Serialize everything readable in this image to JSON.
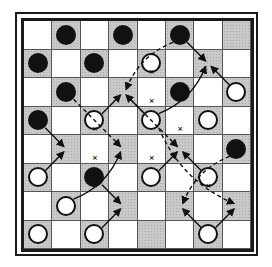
{
  "diagram": {
    "type": "checkerboard-move-diagram",
    "size": 8,
    "dark_square_color": "#c9c9c9",
    "light_square_color": "#ffffff",
    "pieces": [
      {
        "row": 0,
        "col": 1,
        "color": "black"
      },
      {
        "row": 0,
        "col": 3,
        "color": "black"
      },
      {
        "row": 0,
        "col": 5,
        "color": "black"
      },
      {
        "row": 1,
        "col": 0,
        "color": "black"
      },
      {
        "row": 1,
        "col": 2,
        "color": "black"
      },
      {
        "row": 1,
        "col": 4,
        "color": "white"
      },
      {
        "row": 2,
        "col": 1,
        "color": "black"
      },
      {
        "row": 2,
        "col": 5,
        "color": "black"
      },
      {
        "row": 2,
        "col": 7,
        "color": "white"
      },
      {
        "row": 3,
        "col": 0,
        "color": "black"
      },
      {
        "row": 3,
        "col": 2,
        "color": "white"
      },
      {
        "row": 3,
        "col": 4,
        "color": "white"
      },
      {
        "row": 3,
        "col": 6,
        "color": "white"
      },
      {
        "row": 4,
        "col": 7,
        "color": "black"
      },
      {
        "row": 5,
        "col": 0,
        "color": "white"
      },
      {
        "row": 5,
        "col": 2,
        "color": "black"
      },
      {
        "row": 5,
        "col": 4,
        "color": "white"
      },
      {
        "row": 5,
        "col": 6,
        "color": "white"
      },
      {
        "row": 6,
        "col": 1,
        "color": "white"
      },
      {
        "row": 7,
        "col": 0,
        "color": "white"
      },
      {
        "row": 7,
        "col": 2,
        "color": "white"
      },
      {
        "row": 7,
        "col": 6,
        "color": "white"
      }
    ],
    "solid_arrows": [
      {
        "from": [
          5,
          0
        ],
        "to": [
          4,
          1
        ]
      },
      {
        "from": [
          6,
          1
        ],
        "to": [
          4,
          3
        ],
        "curved": true
      },
      {
        "from": [
          7,
          2
        ],
        "to": [
          6,
          3
        ]
      },
      {
        "from": [
          3,
          2
        ],
        "to": [
          2,
          3
        ]
      },
      {
        "from": [
          3,
          4
        ],
        "to": [
          2,
          3
        ]
      },
      {
        "from": [
          3,
          4
        ],
        "to": [
          1,
          6
        ],
        "curved": true
      },
      {
        "from": [
          2,
          7
        ],
        "to": [
          1,
          6
        ]
      },
      {
        "from": [
          0,
          5
        ],
        "to": [
          1,
          6
        ]
      },
      {
        "from": [
          5,
          4
        ],
        "to": [
          4,
          5
        ]
      },
      {
        "from": [
          5,
          6
        ],
        "to": [
          4,
          5
        ]
      },
      {
        "from": [
          7,
          6
        ],
        "to": [
          6,
          5
        ]
      },
      {
        "from": [
          7,
          6
        ],
        "to": [
          6,
          7
        ]
      },
      {
        "from": [
          3,
          0
        ],
        "to": [
          4,
          1
        ]
      },
      {
        "from": [
          5,
          2
        ],
        "to": [
          6,
          3
        ]
      }
    ],
    "dashed_arrows": [
      {
        "from": [
          0,
          5
        ],
        "to": [
          2,
          3
        ],
        "curved": true
      },
      {
        "from": [
          2,
          1
        ],
        "to": [
          4,
          3
        ]
      },
      {
        "from": [
          2,
          3
        ],
        "to": [
          4,
          5
        ]
      },
      {
        "from": [
          3,
          4
        ],
        "to": [
          6,
          7
        ],
        "curved": true
      },
      {
        "from": [
          4,
          7
        ],
        "to": [
          6,
          5
        ],
        "curved": true
      }
    ],
    "x_marks": [
      [
        1,
        4
      ],
      [
        3,
        2
      ],
      [
        2,
        4
      ],
      [
        4,
        2
      ],
      [
        3,
        5
      ],
      [
        5,
        2
      ],
      [
        5,
        6
      ],
      [
        4,
        4
      ]
    ]
  }
}
